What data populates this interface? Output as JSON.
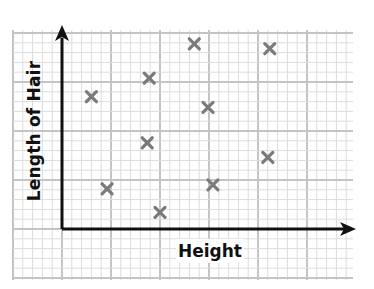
{
  "chart_data": {
    "type": "scatter",
    "title": "",
    "xlabel": "Height",
    "ylabel": "Length of Hair",
    "xlim": [
      0,
      30
    ],
    "ylim": [
      0,
      20
    ],
    "grid": true,
    "legend": null,
    "marker": "x",
    "marker_color": "#7a7a7a",
    "tick_labels": false,
    "points": [
      {
        "x": 3.0,
        "y": 13.5
      },
      {
        "x": 8.9,
        "y": 15.4
      },
      {
        "x": 13.5,
        "y": 18.9
      },
      {
        "x": 21.2,
        "y": 18.4
      },
      {
        "x": 14.9,
        "y": 12.4
      },
      {
        "x": 8.7,
        "y": 8.8
      },
      {
        "x": 21.0,
        "y": 7.3
      },
      {
        "x": 4.6,
        "y": 4.1
      },
      {
        "x": 15.4,
        "y": 4.5
      },
      {
        "x": 10.0,
        "y": 1.7
      }
    ]
  },
  "colors": {
    "grid_minor": "#dcdcdc",
    "grid_major": "#c4c4c4",
    "axis": "#111111",
    "marker": "#7a7a7a"
  }
}
